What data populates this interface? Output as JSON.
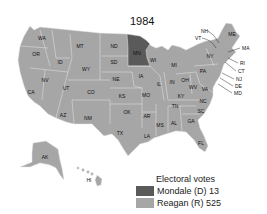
{
  "title": "1984",
  "colors": {
    "reagan": "#a6a6a6",
    "mondale": "#5a5a5a",
    "border": "#e6e6e6"
  },
  "states": [
    {
      "abbr": "WA",
      "x": 42,
      "y": 38,
      "party": "R"
    },
    {
      "abbr": "OR",
      "x": 36,
      "y": 54,
      "party": "R"
    },
    {
      "abbr": "CA",
      "x": 31,
      "y": 92,
      "party": "R"
    },
    {
      "abbr": "NV",
      "x": 45,
      "y": 80,
      "party": "R"
    },
    {
      "abbr": "ID",
      "x": 60,
      "y": 62,
      "party": "R"
    },
    {
      "abbr": "MT",
      "x": 80,
      "y": 46,
      "party": "R"
    },
    {
      "abbr": "WY",
      "x": 86,
      "y": 69,
      "party": "R"
    },
    {
      "abbr": "UT",
      "x": 66,
      "y": 88,
      "party": "R"
    },
    {
      "abbr": "CO",
      "x": 91,
      "y": 92,
      "party": "R"
    },
    {
      "abbr": "AZ",
      "x": 63,
      "y": 115,
      "party": "R"
    },
    {
      "abbr": "NM",
      "x": 88,
      "y": 118,
      "party": "R"
    },
    {
      "abbr": "ND",
      "x": 114,
      "y": 46,
      "party": "R"
    },
    {
      "abbr": "SD",
      "x": 114,
      "y": 62,
      "party": "R"
    },
    {
      "abbr": "NE",
      "x": 116,
      "y": 79,
      "party": "R"
    },
    {
      "abbr": "KS",
      "x": 122,
      "y": 96,
      "party": "R"
    },
    {
      "abbr": "OK",
      "x": 127,
      "y": 112,
      "party": "R"
    },
    {
      "abbr": "TX",
      "x": 120,
      "y": 133,
      "party": "R"
    },
    {
      "abbr": "MN",
      "x": 137,
      "y": 53,
      "party": "D"
    },
    {
      "abbr": "IA",
      "x": 141,
      "y": 76,
      "party": "R"
    },
    {
      "abbr": "MO",
      "x": 146,
      "y": 95,
      "party": "R"
    },
    {
      "abbr": "AR",
      "x": 147,
      "y": 116,
      "party": "R"
    },
    {
      "abbr": "LA",
      "x": 147,
      "y": 136,
      "party": "R"
    },
    {
      "abbr": "WI",
      "x": 153,
      "y": 60,
      "party": "R"
    },
    {
      "abbr": "IL",
      "x": 159,
      "y": 84,
      "party": "R"
    },
    {
      "abbr": "MI",
      "x": 174,
      "y": 65,
      "party": "R"
    },
    {
      "abbr": "IN",
      "x": 172,
      "y": 82,
      "party": "R"
    },
    {
      "abbr": "OH",
      "x": 185,
      "y": 80,
      "party": "R"
    },
    {
      "abbr": "KY",
      "x": 181,
      "y": 96,
      "party": "R"
    },
    {
      "abbr": "TN",
      "x": 175,
      "y": 106,
      "party": "R"
    },
    {
      "abbr": "MS",
      "x": 160,
      "y": 125,
      "party": "R"
    },
    {
      "abbr": "AL",
      "x": 174,
      "y": 123,
      "party": "R"
    },
    {
      "abbr": "GA",
      "x": 191,
      "y": 121,
      "party": "R"
    },
    {
      "abbr": "FL",
      "x": 201,
      "y": 143,
      "party": "R"
    },
    {
      "abbr": "SC",
      "x": 201,
      "y": 111,
      "party": "R"
    },
    {
      "abbr": "NC",
      "x": 203,
      "y": 101,
      "party": "R"
    },
    {
      "abbr": "VA",
      "x": 205,
      "y": 89,
      "party": "R"
    },
    {
      "abbr": "WV",
      "x": 193,
      "y": 87,
      "party": "R"
    },
    {
      "abbr": "PA",
      "x": 203,
      "y": 71,
      "party": "R"
    },
    {
      "abbr": "NY",
      "x": 210,
      "y": 56,
      "party": "R"
    },
    {
      "abbr": "ME",
      "x": 232,
      "y": 34,
      "party": "R"
    },
    {
      "abbr": "AK",
      "x": 45,
      "y": 157,
      "party": "R"
    },
    {
      "abbr": "HI",
      "x": 89,
      "y": 180,
      "party": "R"
    }
  ],
  "callouts": [
    {
      "abbr": "NH",
      "x": 201,
      "y": 31
    },
    {
      "abbr": "VT",
      "x": 195,
      "y": 38
    },
    {
      "abbr": "MA",
      "x": 242,
      "y": 48
    },
    {
      "abbr": "RI",
      "x": 240,
      "y": 63
    },
    {
      "abbr": "CT",
      "x": 238,
      "y": 71
    },
    {
      "abbr": "NJ",
      "x": 236,
      "y": 79
    },
    {
      "abbr": "DE",
      "x": 235,
      "y": 86
    },
    {
      "abbr": "MD",
      "x": 234,
      "y": 93
    }
  ],
  "legend": {
    "title": "Electoral votes",
    "items": [
      {
        "label": "Mondale (D) 13",
        "party": "D"
      },
      {
        "label": "Reagan (R) 525",
        "party": "R"
      }
    ]
  }
}
